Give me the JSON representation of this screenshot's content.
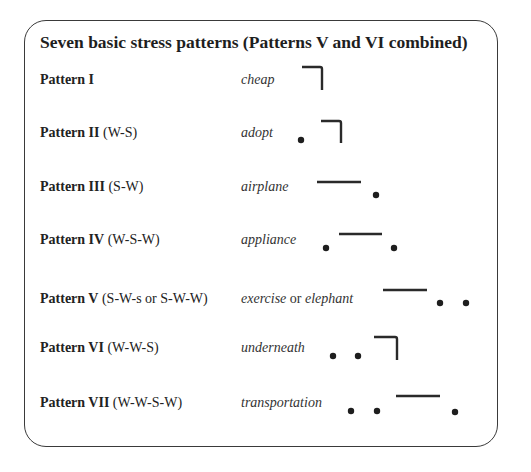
{
  "title": "Seven basic stress patterns (Patterns V and VI combined)",
  "legend": {
    "bar": "stressed syllable (strong)",
    "bracket": "stressed final syllable with pitch fall",
    "dot": "unstressed syllable (weak)"
  },
  "patterns": [
    {
      "name": "Pattern I",
      "code": "",
      "example": "cheap",
      "example_or": "",
      "example2": "",
      "glyphs": [
        "bracket"
      ]
    },
    {
      "name": "Pattern II",
      "code": "(W-S)",
      "example": "adopt",
      "example_or": "",
      "example2": "",
      "glyphs": [
        "dot",
        "bracket"
      ]
    },
    {
      "name": "Pattern III",
      "code": "(S-W)",
      "example": "airplane",
      "example_or": "",
      "example2": "",
      "glyphs": [
        "bar",
        "dot"
      ]
    },
    {
      "name": "Pattern IV",
      "code": "(W-S-W)",
      "example": "appliance",
      "example_or": "",
      "example2": "",
      "glyphs": [
        "dot",
        "bar",
        "dot"
      ]
    },
    {
      "name": "Pattern V",
      "code": "(S-W-s or S-W-W)",
      "example": "exercise",
      "example_or": "or",
      "example2": "elephant",
      "glyphs": [
        "bar",
        "dot",
        "dot"
      ]
    },
    {
      "name": "Pattern VI",
      "code": "(W-W-S)",
      "example": "underneath",
      "example_or": "",
      "example2": "",
      "glyphs": [
        "dot",
        "dot",
        "bracket"
      ]
    },
    {
      "name": "Pattern VII",
      "code": "(W-W-S-W)",
      "example": "transportation",
      "example_or": "",
      "example2": "",
      "glyphs": [
        "dot",
        "dot",
        "bar",
        "dot"
      ]
    }
  ]
}
